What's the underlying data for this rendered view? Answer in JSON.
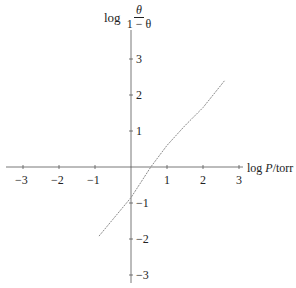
{
  "chart_data": {
    "type": "line",
    "title": "",
    "xlabel": "log P/torr",
    "ylabel": "log θ/(1 − θ)",
    "ylabel_parts": {
      "prefix": "log",
      "numerator": "θ",
      "denominator": "1 − θ"
    },
    "xlabel_parts": {
      "prefix": "log ",
      "var": "P",
      "unit": "/torr"
    },
    "xlim": [
      -3.3,
      3
    ],
    "ylim": [
      -3,
      3.5
    ],
    "grid": false,
    "x_ticks": [
      -3,
      -2,
      -1,
      1,
      2,
      3
    ],
    "y_ticks": [
      3,
      2,
      1,
      -1,
      -2,
      -3
    ],
    "x_tick_labels": [
      "−3",
      "−2",
      "−1",
      "1",
      "2",
      "3"
    ],
    "y_tick_labels": [
      "3",
      "2",
      "1",
      "−1",
      "−2",
      "−3"
    ],
    "series": [
      {
        "name": "Langmuir plot",
        "x": [
          -0.89,
          -0.5,
          0,
          0.55,
          1.0,
          1.5,
          2.0,
          2.6
        ],
        "y": [
          -1.92,
          -1.45,
          -0.85,
          0.0,
          0.6,
          1.15,
          1.65,
          2.4
        ]
      }
    ],
    "line_color": "#8a8a8a",
    "axis_color": "#555555"
  }
}
